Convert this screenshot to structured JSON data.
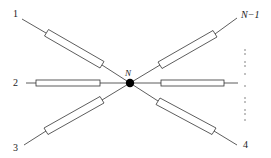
{
  "diagram": {
    "type": "star-network",
    "center_node": {
      "label": "N",
      "x": 130,
      "y": 83
    },
    "terminals": [
      {
        "label": "1",
        "position": "upper-left"
      },
      {
        "label": "2",
        "position": "left"
      },
      {
        "label": "3",
        "position": "lower-left"
      },
      {
        "label": "4",
        "position": "lower-right"
      },
      {
        "label": "N−1",
        "position": "upper-right"
      }
    ],
    "ellipsis": "vertical dotted line indicating additional terminals between 4 and N−1",
    "colors": {
      "stroke": "#333333",
      "node_fill": "#000000",
      "background": "#ffffff"
    }
  }
}
